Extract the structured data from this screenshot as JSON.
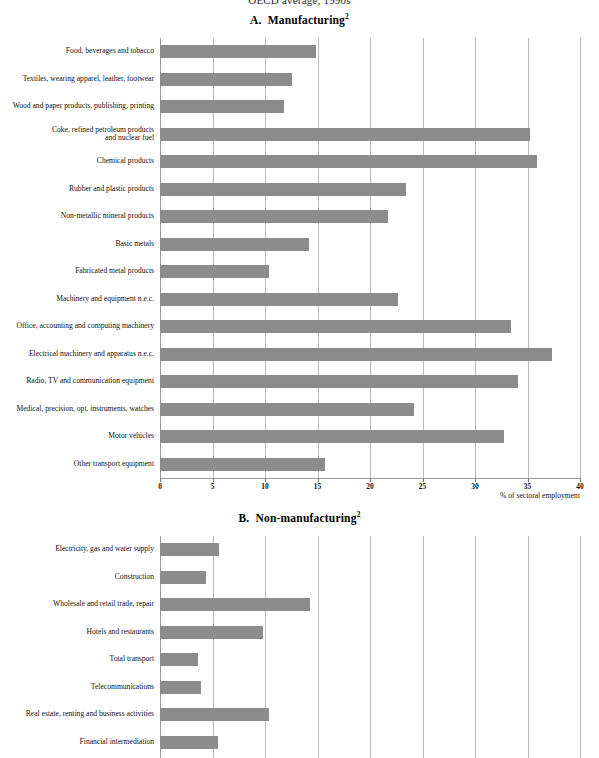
{
  "supertitle": "OECD average, 1990s",
  "panels": {
    "a": {
      "label": "A.",
      "title": "Manufacturing",
      "footnote_marker": "2"
    },
    "b": {
      "label": "B.",
      "title": "Non-manufacturing",
      "footnote_marker": "2"
    }
  },
  "axis": {
    "caption": "% of sectoral employment",
    "ticks": [
      "0",
      "5",
      "10",
      "15",
      "20",
      "25",
      "30",
      "35",
      "40"
    ]
  },
  "colors": {
    "bar": "#8c8c8c",
    "gridline": "#b9b9b9",
    "text": "#111111"
  },
  "chart_data": [
    {
      "type": "bar",
      "title": "A. Manufacturing",
      "orientation": "horizontal",
      "xlabel": "% of sectoral employment",
      "ylabel": "",
      "xlim": [
        0,
        40
      ],
      "xticks": [
        0,
        5,
        10,
        15,
        20,
        25,
        30,
        35,
        40
      ],
      "grid": true,
      "legend": "none",
      "categories": [
        "Food, beverages and tobacco",
        "Textiles, wearing apparel, leather, footwear",
        "Wood and paper products, publishing, printing",
        "Coke, refined petroleum products\nand nuclear fuel",
        "Chemical products",
        "Rubber and plastic products",
        "Non-metallic mineral products",
        "Basic metals",
        "Fabricated metal products",
        "Machinery and equipment n.e.c.",
        "Office, accounting and computing machinery",
        "Electrical machinery and apparatus n.e.c.",
        "Radio, TV and communication equipment",
        "Medical, precision, opt. instruments, watches",
        "Motor vehicles",
        "Other transport equipment"
      ],
      "values": [
        14.9,
        12.6,
        11.8,
        35.2,
        35.9,
        23.4,
        21.7,
        14.2,
        10.4,
        22.7,
        33.4,
        37.3,
        34.1,
        24.2,
        32.8,
        15.7
      ]
    },
    {
      "type": "bar",
      "title": "B. Non-manufacturing",
      "orientation": "horizontal",
      "xlabel": "% of sectoral employment",
      "ylabel": "",
      "xlim": [
        0,
        40
      ],
      "xticks": [
        0,
        5,
        10,
        15,
        20,
        25,
        30,
        35,
        40
      ],
      "grid": true,
      "legend": "none",
      "categories": [
        "Electricity, gas and water supply",
        "Construction",
        "Wholesale and retail trade, repair",
        "Hotels and restaurants",
        "Total transport",
        "Telecommunications",
        "Real estate, renting and business activities",
        "Financial intermediation"
      ],
      "values": [
        5.6,
        4.4,
        14.3,
        9.8,
        3.6,
        3.9,
        10.4,
        5.5
      ]
    }
  ]
}
